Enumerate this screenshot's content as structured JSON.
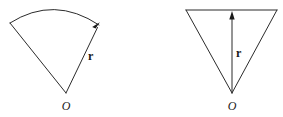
{
  "figure": {
    "background_color": "#ffffff",
    "stroke_color": "#2b2b2b",
    "label_color": "#1a1a1a",
    "caption": "",
    "panels": [
      {
        "id": "circular-sector",
        "name": "circular-sector-figure",
        "shape": "circular sector",
        "center_label": "O",
        "radius_label": "r",
        "has_arc": true,
        "arrow_on": "radius",
        "arrow_direction": "outward along right radius",
        "geometry": {
          "apex_x": 66,
          "apex_y": 93,
          "left_end_x": 10,
          "left_end_y": 23,
          "right_end_x": 99,
          "right_end_y": 25,
          "arc_peak_x": 55,
          "arc_peak_y": 8,
          "radius_label_x": 88,
          "radius_label_y": 60,
          "center_label_x": 66,
          "center_label_y": 110
        }
      },
      {
        "id": "triangle",
        "name": "triangle-figure",
        "shape": "isosceles triangle",
        "center_label": "O",
        "radius_label": "r",
        "has_arc": false,
        "arrow_on": "vertical median",
        "arrow_direction": "upward from apex to base",
        "geometry": {
          "apex_x": 232,
          "apex_y": 93,
          "top_left_x": 186,
          "top_left_y": 10,
          "top_right_x": 277,
          "top_right_y": 10,
          "arrow_tip_x": 232,
          "arrow_tip_y": 12,
          "radius_label_x": 239,
          "radius_label_y": 57,
          "center_label_x": 232,
          "center_label_y": 110
        }
      }
    ]
  }
}
